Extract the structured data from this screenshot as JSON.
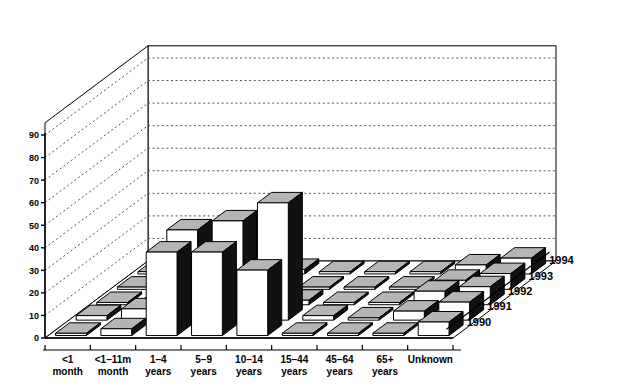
{
  "chart_data": {
    "type": "bar",
    "title": "",
    "subtitle": "",
    "xlabel": "",
    "ylabel": "",
    "zlabel": "",
    "grid": true,
    "legend_position": "none",
    "projection": "3d",
    "ylim": [
      0,
      90
    ],
    "yticks": [
      0,
      10,
      20,
      30,
      40,
      50,
      60,
      70,
      80,
      90
    ],
    "ytick_labels": [
      "0",
      "10",
      "20",
      "30",
      "40",
      "50",
      "60",
      "70",
      "80",
      "90"
    ],
    "categories": [
      "<1\nmonth",
      "<1–11m\nmonth",
      "1–4\nyears",
      "5–9\nyears",
      "10–14\nyears",
      "15–44\nyears",
      "45–64\nyears",
      "65+\nyears",
      "Unknown"
    ],
    "category_lines": [
      [
        "<1",
        "month"
      ],
      [
        "<1–11m",
        "month"
      ],
      [
        "1–4",
        "years"
      ],
      [
        "5–9",
        "years"
      ],
      [
        "10–14",
        "years"
      ],
      [
        "15–44",
        "years"
      ],
      [
        "45–64",
        "years"
      ],
      [
        "65+",
        "years"
      ],
      [
        "Unknown",
        ""
      ]
    ],
    "depth_labels": [
      "1990",
      "1991",
      "1992",
      "1993",
      "1994"
    ],
    "series": [
      {
        "name": "1990",
        "values": [
          1,
          3,
          37,
          37,
          29,
          1,
          1,
          1,
          6
        ]
      },
      {
        "name": "1991",
        "values": [
          2,
          5,
          40,
          44,
          52,
          2,
          1,
          4,
          8
        ]
      },
      {
        "name": "1992",
        "values": [
          1,
          2,
          2,
          4,
          2,
          1,
          1,
          6,
          8
        ]
      },
      {
        "name": "1993",
        "values": [
          1,
          1,
          2,
          3,
          1,
          1,
          1,
          4,
          7
        ]
      },
      {
        "name": "1994",
        "values": [
          1,
          1,
          1,
          2,
          1,
          1,
          1,
          4,
          7
        ]
      }
    ],
    "bar_colors": {
      "front": "#ffffff",
      "top": "#b5b5b5",
      "side": "#111111",
      "edge": "#000000"
    }
  },
  "colors": {
    "background": "#ffffff",
    "axis": "#000000",
    "grid": "#555555",
    "wall": "#ffffff",
    "floor": "#ffffff"
  }
}
